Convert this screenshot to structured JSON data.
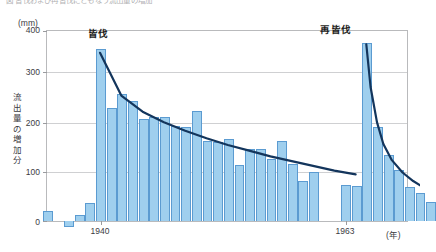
{
  "caption": {
    "text": "図  皆伐および再皆伐にともなう流出量の増加"
  },
  "axes": {
    "y_unit": "(mm)",
    "x_unit": "(年)",
    "y_title_chars": [
      "流",
      "出",
      "量",
      "の",
      "増",
      "加",
      "分"
    ],
    "y_ticks": [
      "400",
      "300",
      "200",
      "100",
      "0"
    ],
    "x_ticks": [
      {
        "label": "1940",
        "x_px": 100
      },
      {
        "label": "1963",
        "x_px": 345
      }
    ]
  },
  "annotations": [
    {
      "name": "clearcut",
      "label": "皆伐",
      "x_px": 98,
      "y_px": 26
    },
    {
      "name": "re-clearcut",
      "label": "再皆伐",
      "x_px": 336,
      "y_px": 22
    }
  ],
  "colors": {
    "bar_fill": "#9fcfee",
    "bar_stroke": "#5b9bd1",
    "curve": "#13355c",
    "grid": "#cfd0d2",
    "frame": "#b9babc",
    "text": "#3b3b3f"
  },
  "chart_data": {
    "type": "bar",
    "title": "皆伐および再皆伐にともなう流出量の増加",
    "xlabel": "(年)",
    "ylabel": "流出量の増加分",
    "y_unit": "mm",
    "ylim": [
      -20,
      400
    ],
    "xlim": [
      1933,
      1972
    ],
    "grid": true,
    "gridlines": [
      0,
      100,
      200,
      300,
      400
    ],
    "legend": "none",
    "categories": [
      1934,
      1935,
      1936,
      1937,
      1938,
      1939,
      1940,
      1941,
      1942,
      1943,
      1944,
      1945,
      1946,
      1947,
      1948,
      1949,
      1950,
      1951,
      1952,
      1953,
      1954,
      1955,
      1956,
      1957,
      1958,
      1959,
      1960,
      1963,
      1964,
      1965,
      1966,
      1967,
      1968,
      1969,
      1970,
      1971
    ],
    "values": [
      0,
      22,
      0,
      -12,
      12,
      38,
      362,
      238,
      268,
      252,
      214,
      220,
      218,
      200,
      198,
      232,
      168,
      166,
      172,
      118,
      152,
      152,
      130,
      168,
      120,
      84,
      104,
      76,
      74,
      374,
      198,
      140,
      108,
      72,
      58,
      40
    ],
    "annotations": [
      {
        "label": "皆伐",
        "at_year": 1940,
        "meaning": "clear-cutting"
      },
      {
        "label": "再皆伐",
        "at_year": 1965,
        "meaning": "re-clear-cutting"
      }
    ],
    "series_overlay": [
      {
        "name": "decay-curve-1",
        "type": "line",
        "color": "#13355c",
        "x": [
          1940,
          1942,
          1944,
          1946,
          1948,
          1950,
          1952,
          1954,
          1956,
          1958,
          1960,
          1962,
          1964
        ],
        "y": [
          352,
          262,
          228,
          206,
          188,
          172,
          158,
          146,
          134,
          124,
          114,
          104,
          96
        ]
      },
      {
        "name": "decay-curve-2",
        "type": "line",
        "color": "#13355c",
        "x": [
          1965,
          1965.4,
          1966,
          1966.6,
          1967.4,
          1968.4,
          1969.4,
          1970.4,
          1971.5
        ],
        "y": [
          370,
          280,
          206,
          160,
          126,
          100,
          82,
          68,
          58
        ]
      }
    ]
  }
}
